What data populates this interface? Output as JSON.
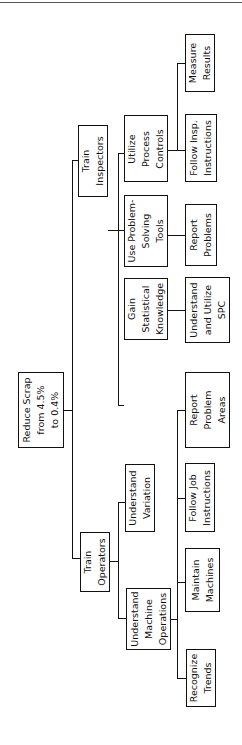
{
  "diagram": {
    "type": "tree",
    "orientation": "rotated-90-ccw",
    "root": {
      "label": "Reduce Scrap\nfrom 4.5%\nto 0.4%"
    },
    "branches": [
      {
        "label": "Train\nInspectors",
        "children": [
          {
            "label": "Utilize\nProcess\nControls",
            "leaves": [
              "Measure\nResults",
              "Follow Insp.\nInstructions"
            ]
          },
          {
            "label": "Use Problem-\nSolving\nTools",
            "leaves": [
              "Report\nProblems"
            ]
          },
          {
            "label": "Gain\nStatistical\nKnowledge",
            "leaves": [
              "Understand\nand Utilize\nSPC"
            ]
          }
        ]
      },
      {
        "label": "Train\nOperators",
        "children": [
          {
            "label": "Understand\nVariation",
            "leaves": []
          },
          {
            "label": "Understand\nMachine\nOperations",
            "leaves": [
              "Report\nProblem\nAreas",
              "Follow Job\nInstructions",
              "Maintain\nMachines",
              "Recognize\nTrends"
            ]
          }
        ]
      }
    ]
  },
  "nodes": {
    "root": "Reduce Scrap\nfrom 4.5%\nto 0.4%",
    "train_inspectors": "Train\nInspectors",
    "train_operators": "Train\nOperators",
    "utilize_process_controls": "Utilize\nProcess\nControls",
    "use_problem_solving_tools": "Use Problem-\nSolving\nTools",
    "gain_statistical_knowledge": "Gain\nStatistical\nKnowledge",
    "understand_variation": "Understand\nVariation",
    "understand_machine_operations": "Understand\nMachine\nOperations",
    "measure_results": "Measure\nResults",
    "follow_insp_instructions": "Follow Insp.\nInstructions",
    "report_problems": "Report\nProblems",
    "understand_utilize_spc": "Understand\nand Utilize\nSPC",
    "report_problem_areas": "Report\nProblem\nAreas",
    "follow_job_instructions": "Follow Job\nInstructions",
    "maintain_machines": "Maintain\nMachines",
    "recognize_trends": "Recognize\nTrends"
  }
}
